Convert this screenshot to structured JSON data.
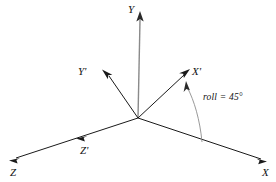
{
  "diagram": {
    "type": "3d-axes-rotation",
    "background_color": "#ffffff",
    "origin": {
      "x": 138,
      "y": 118
    },
    "axes": [
      {
        "id": "Y",
        "label": "Y",
        "kind": "world-axis",
        "color": "#8a8a8a",
        "from": {
          "x": 138,
          "y": 118
        },
        "to": {
          "x": 140,
          "y": 14
        },
        "arrow": "end"
      },
      {
        "id": "X",
        "label": "X",
        "kind": "world-axis",
        "color": "#1a1a1a",
        "from": {
          "x": 138,
          "y": 118
        },
        "to": {
          "x": 266,
          "y": 161
        },
        "arrow": "end"
      },
      {
        "id": "Z",
        "label": "Z",
        "kind": "world-axis",
        "color": "#1a1a1a",
        "from": {
          "x": 138,
          "y": 118
        },
        "to": {
          "x": 11,
          "y": 160
        },
        "arrow": "end"
      },
      {
        "id": "Xp",
        "label": "X'",
        "kind": "rotated-axis",
        "color": "#1a1a1a",
        "from": {
          "x": 138,
          "y": 118
        },
        "to": {
          "x": 188,
          "y": 70
        },
        "arrow": "end"
      },
      {
        "id": "Yp",
        "label": "Y'",
        "kind": "rotated-axis",
        "color": "#1a1a1a",
        "from": {
          "x": 138,
          "y": 118
        },
        "to": {
          "x": 104,
          "y": 71
        },
        "arrow": "end"
      },
      {
        "id": "Zp",
        "label": "Z'",
        "kind": "rotated-axis",
        "color": "#1a1a1a",
        "from": {
          "x": 138,
          "y": 118
        },
        "to": {
          "x": 79,
          "y": 137
        },
        "arrow": "end"
      }
    ],
    "angle_arc": {
      "id": "roll-arc",
      "label": "roll = 45°",
      "value": 45,
      "unit": "degrees",
      "quantity": "roll",
      "color": "#7d7d7d",
      "from": {
        "x": 201,
        "y": 141
      },
      "to": {
        "x": 186,
        "y": 84
      },
      "arrow": "end"
    }
  }
}
